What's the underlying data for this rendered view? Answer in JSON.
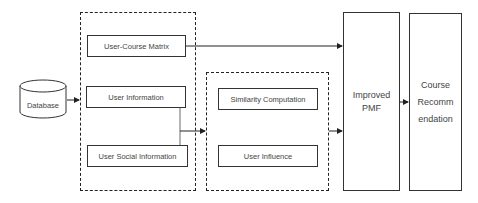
{
  "diagram": {
    "nodes": {
      "database": "Database",
      "user_course_matrix": "User-Course Matrix",
      "user_information": "User Information",
      "user_social_information": "User Social Information",
      "similarity_computation": "Similarity Computation",
      "user_influence": "User Influence",
      "improved_pmf_line1": "Improved",
      "improved_pmf_line2": "PMF",
      "course_rec_line1": "Course",
      "course_rec_line2": "Recomm",
      "course_rec_line3": "endation"
    },
    "edges": [
      {
        "from": "Database",
        "to": "Input group"
      },
      {
        "from": "User-Course Matrix",
        "to": "Improved PMF"
      },
      {
        "from": "User Information + User Social Information",
        "to": "Similarity/Influence group"
      },
      {
        "from": "Similarity/Influence group",
        "to": "Improved PMF"
      },
      {
        "from": "Improved PMF",
        "to": "Course Recommendation"
      }
    ],
    "colors": {
      "line": "#222222",
      "text": "#444444",
      "background": "#ffffff"
    }
  }
}
